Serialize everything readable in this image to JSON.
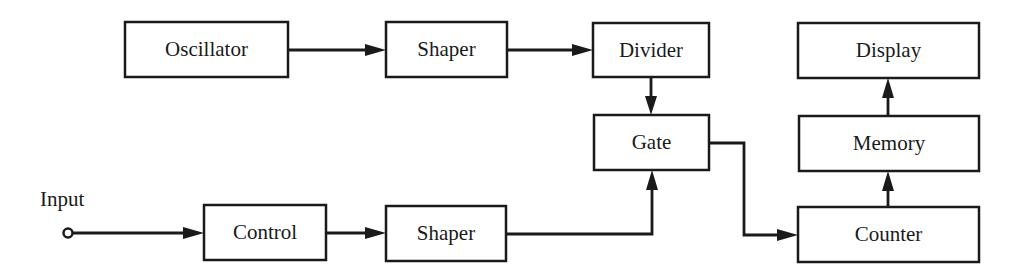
{
  "diagram": {
    "type": "block-diagram",
    "blocks": [
      {
        "id": "oscillator",
        "label": "Oscillator",
        "x": 125,
        "y": 22,
        "w": 163,
        "h": 55
      },
      {
        "id": "shaper_top",
        "label": "Shaper",
        "x": 386,
        "y": 22,
        "w": 121,
        "h": 55
      },
      {
        "id": "divider",
        "label": "Divider",
        "x": 593,
        "y": 23,
        "w": 116,
        "h": 54
      },
      {
        "id": "display",
        "label": "Display",
        "x": 798,
        "y": 23,
        "w": 181,
        "h": 55
      },
      {
        "id": "gate",
        "label": "Gate",
        "x": 594,
        "y": 115,
        "w": 115,
        "h": 55
      },
      {
        "id": "memory",
        "label": "Memory",
        "x": 799,
        "y": 116,
        "w": 180,
        "h": 55
      },
      {
        "id": "control",
        "label": "Control",
        "x": 204,
        "y": 205,
        "w": 122,
        "h": 55
      },
      {
        "id": "shaper_bottom",
        "label": "Shaper",
        "x": 386,
        "y": 206,
        "w": 120,
        "h": 55
      },
      {
        "id": "counter",
        "label": "Counter",
        "x": 798,
        "y": 207,
        "w": 181,
        "h": 55
      }
    ],
    "input": {
      "label": "Input",
      "terminal_x": 68,
      "terminal_y": 233
    },
    "connections": [
      {
        "from": "oscillator",
        "to": "shaper_top"
      },
      {
        "from": "shaper_top",
        "to": "divider"
      },
      {
        "from": "divider",
        "to": "gate"
      },
      {
        "from": "input",
        "to": "control"
      },
      {
        "from": "control",
        "to": "shaper_bottom"
      },
      {
        "from": "shaper_bottom",
        "to": "gate"
      },
      {
        "from": "gate",
        "to": "counter"
      },
      {
        "from": "counter",
        "to": "memory"
      },
      {
        "from": "memory",
        "to": "display"
      }
    ]
  },
  "labels": {
    "oscillator": "Oscillator",
    "shaper_top": "Shaper",
    "divider": "Divider",
    "display": "Display",
    "gate": "Gate",
    "memory": "Memory",
    "control": "Control",
    "shaper_bottom": "Shaper",
    "counter": "Counter",
    "input": "Input"
  }
}
